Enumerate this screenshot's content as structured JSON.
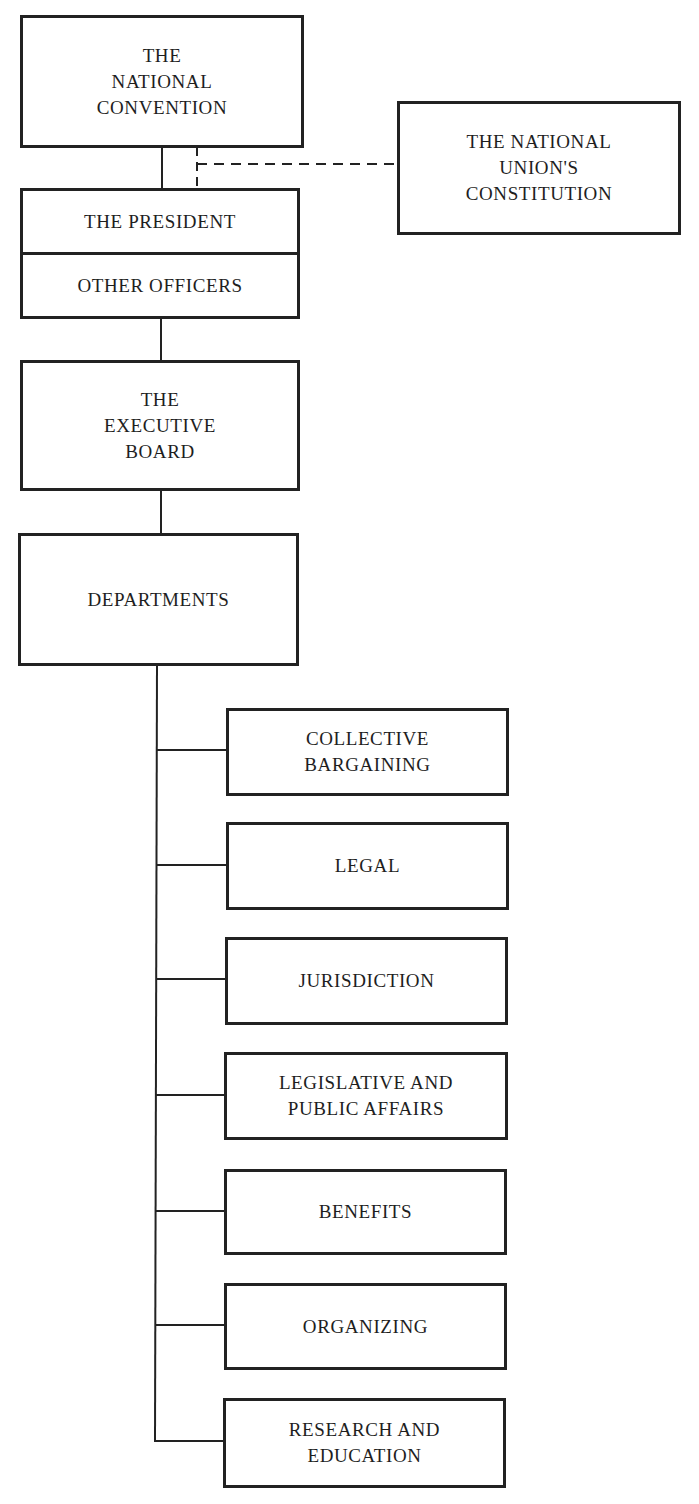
{
  "diagram": {
    "type": "organizational-chart",
    "colors": {
      "line": "#222222",
      "text": "#1e1e1e",
      "background": "#ffffff"
    },
    "nodes": {
      "convention": {
        "label": "THE\nNATIONAL\nCONVENTION"
      },
      "constitution": {
        "label": "THE NATIONAL\nUNION'S\nCONSTITUTION"
      },
      "president": {
        "label": "THE PRESIDENT"
      },
      "other_officers": {
        "label": "OTHER OFFICERS"
      },
      "executive_board": {
        "label": "THE\nEXECUTIVE\nBOARD"
      },
      "departments": {
        "label": "DEPARTMENTS"
      }
    },
    "department_list": [
      {
        "label": "COLLECTIVE\nBARGAINING"
      },
      {
        "label": "LEGAL"
      },
      {
        "label": "JURISDICTION"
      },
      {
        "label": "LEGISLATIVE AND\nPUBLIC AFFAIRS"
      },
      {
        "label": "BENEFITS"
      },
      {
        "label": "ORGANIZING"
      },
      {
        "label": "RESEARCH AND\nEDUCATION"
      }
    ],
    "edges": [
      {
        "from": "convention",
        "to": "president",
        "style": "solid"
      },
      {
        "from": "constitution",
        "to": "president",
        "style": "dashed"
      },
      {
        "from": "other_officers",
        "to": "executive_board",
        "style": "solid"
      },
      {
        "from": "executive_board",
        "to": "departments",
        "style": "solid"
      },
      {
        "from": "departments",
        "to": "department_list",
        "style": "solid-tree"
      }
    ]
  }
}
